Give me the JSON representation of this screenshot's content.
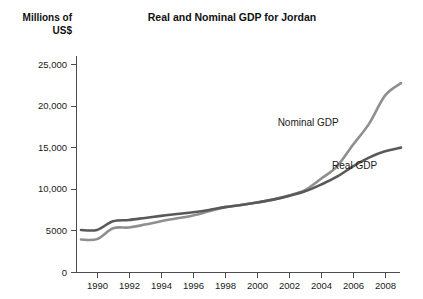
{
  "figure": {
    "width": 423,
    "height": 299,
    "background": "#ffffff"
  },
  "chart_data": {
    "type": "line",
    "title": "Real and Nominal GDP for Jordan",
    "xlabel": "",
    "ylabel": "Millions of US$",
    "ylabel_line1": "Millions of",
    "ylabel_line2": "US$",
    "grid": false,
    "legend_position": "inline-annotations",
    "xlim": [
      1989,
      2009
    ],
    "ylim": [
      0,
      26500
    ],
    "x_ticks": [
      1990,
      1992,
      1994,
      1996,
      1998,
      2000,
      2002,
      2004,
      2006,
      2008
    ],
    "x_tick_labels": [
      "1990",
      "1992",
      "1994",
      "1996",
      "1998",
      "2000",
      "2002",
      "2004",
      "2006",
      "2008"
    ],
    "y_ticks": [
      0,
      5000,
      10000,
      15000,
      20000,
      25000
    ],
    "y_tick_labels": [
      "0",
      "5000",
      "10,000",
      "15,000",
      "20,000",
      "25,000"
    ],
    "x": [
      1989,
      1990,
      1991,
      1992,
      1993,
      1994,
      1995,
      1996,
      1997,
      1998,
      1999,
      2000,
      2001,
      2002,
      2003,
      2004,
      2005,
      2006,
      2007,
      2008,
      2009
    ],
    "series": [
      {
        "name": "Real GDP",
        "color": "#595959",
        "label": "Real GDP",
        "label_x": 2006.1,
        "label_y": 12400,
        "values": [
          5050,
          5060,
          6100,
          6250,
          6500,
          6750,
          6980,
          7180,
          7450,
          7800,
          8050,
          8350,
          8700,
          9150,
          9700,
          10500,
          11450,
          12700,
          13750,
          14500,
          14950
        ]
      },
      {
        "name": "Nominal GDP",
        "color": "#8f8f8f",
        "label": "Nominal GDP",
        "label_x": 2003.2,
        "label_y": 17600,
        "values": [
          3900,
          3950,
          5250,
          5350,
          5700,
          6100,
          6450,
          6800,
          7300,
          7800,
          8050,
          8350,
          8700,
          9200,
          9850,
          11200,
          12700,
          15300,
          17800,
          21200,
          22700
        ]
      }
    ],
    "annotations": [
      {
        "text": "Nominal GDP",
        "series": "Nominal GDP"
      },
      {
        "text": "Real GDP",
        "series": "Real GDP"
      }
    ]
  },
  "geometry": {
    "plot_left": 76,
    "plot_right": 400,
    "plot_top": 56,
    "plot_bottom": 272,
    "y_zero_px": 272,
    "y_25000_px": 64,
    "x_1990_px": 97,
    "x_per_year_px": 16
  },
  "colors": {
    "real_gdp": "#595959",
    "nominal_gdp": "#8f8f8f",
    "axis": "#4d4d4d",
    "text": "#1a1a1a",
    "background": "#ffffff"
  }
}
